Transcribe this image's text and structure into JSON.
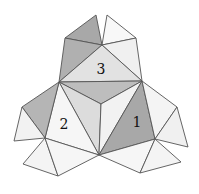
{
  "diagram": {
    "colors": {
      "light": "#f2f2f2",
      "lighter": "#f8f8f8",
      "mid": "#d8d8d8",
      "medium": "#bdbdbd",
      "dark": "#a8a8a8",
      "stroke": "#555555"
    },
    "faces": [
      {
        "id": "top-left-flap",
        "points": "96,15 65,38 102,45",
        "fill": "#a8a8a8"
      },
      {
        "id": "top-right-flap",
        "points": "107,15 102,45 136,38",
        "fill": "#f8f8f8"
      },
      {
        "id": "upper-left-dark",
        "points": "65,38 59,82 102,45",
        "fill": "#b0b0b0"
      },
      {
        "id": "upper-right-light",
        "points": "102,45 136,38 142,81",
        "fill": "#f0f0f0"
      },
      {
        "id": "face-3",
        "points": "59,82 102,45 142,81",
        "fill": "#e2e2e2"
      },
      {
        "id": "center-shaded",
        "points": "59,82 142,81 101,104",
        "fill": "#bdbdbd"
      },
      {
        "id": "center-left",
        "points": "59,82 101,104 99,155",
        "fill": "#dcdcdc"
      },
      {
        "id": "center-right",
        "points": "142,81 101,104 99,155",
        "fill": "#f2f2f2"
      },
      {
        "id": "face-2",
        "points": "59,82 45,138 99,155",
        "fill": "#f6f6f6"
      },
      {
        "id": "left-flap-dark",
        "points": "59,82 22,107 45,138",
        "fill": "#b5b5b5"
      },
      {
        "id": "left-flap-light",
        "points": "22,107 14,141 45,138",
        "fill": "#f2f2f2"
      },
      {
        "id": "bottom-left-a",
        "points": "45,138 23,164 58,176",
        "fill": "#f4f4f4"
      },
      {
        "id": "bottom-left-b",
        "points": "45,138 58,176 99,155",
        "fill": "#f6f6f6"
      },
      {
        "id": "face-1",
        "points": "142,81 99,155 155,139",
        "fill": "#a8a8a8"
      },
      {
        "id": "right-flap-a",
        "points": "142,81 177,107 155,139",
        "fill": "#f4f4f4"
      },
      {
        "id": "right-flap-b",
        "points": "177,107 188,147 155,139",
        "fill": "#f0f0f0"
      },
      {
        "id": "bottom-right-a",
        "points": "99,155 140,173 155,139",
        "fill": "#f6f6f6"
      },
      {
        "id": "bottom-right-b",
        "points": "155,139 140,173 181,162",
        "fill": "#f4f4f4"
      }
    ],
    "labels": [
      {
        "text": "3",
        "x": 101,
        "y": 70
      },
      {
        "text": "2",
        "x": 64,
        "y": 125
      },
      {
        "text": "1",
        "x": 137,
        "y": 123
      }
    ]
  }
}
